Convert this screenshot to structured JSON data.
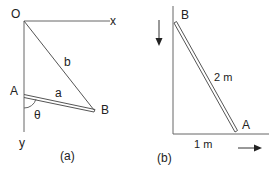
{
  "panel_a": {
    "caption": "(a)",
    "origin_label": "O",
    "x_axis_label": "x",
    "y_axis_label": "y",
    "point_a_label": "A",
    "point_b_label": "B",
    "rod_label": "a",
    "string_label": "b",
    "angle_label": "θ"
  },
  "panel_b": {
    "caption": "(b)",
    "point_b_label": "B",
    "point_a_label": "A",
    "rod_length_label": "2 m",
    "base_distance_label": "1 m",
    "arrow_down": "down-arrow",
    "arrow_right": "right-arrow"
  },
  "colors": {
    "line": "#555555",
    "text": "#222222"
  }
}
